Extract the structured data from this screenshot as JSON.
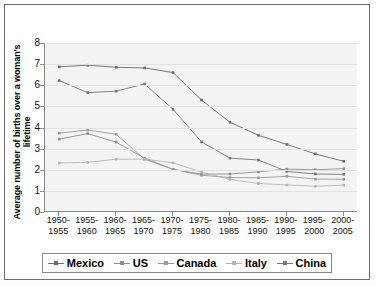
{
  "chart_data": {
    "type": "line",
    "title": "",
    "xlabel": "",
    "ylabel": "Average number of births over a woman's lifetime",
    "ylim": [
      0,
      8
    ],
    "yticks": [
      0,
      1,
      2,
      3,
      4,
      5,
      6,
      7,
      8
    ],
    "grid": true,
    "legend_position": "bottom",
    "categories": [
      "1950-1955",
      "1955-1960",
      "1960-1965",
      "1965-1970",
      "1970-1975",
      "1975-1980",
      "1980-1985",
      "1985-1990",
      "1990-1995",
      "1995-2000",
      "2000-2005"
    ],
    "categories_lines": [
      [
        "1950-",
        "1955"
      ],
      [
        "1955-",
        "1960"
      ],
      [
        "1960-",
        "1965"
      ],
      [
        "1965-",
        "1970"
      ],
      [
        "1970-",
        "1975"
      ],
      [
        "1975-",
        "1980"
      ],
      [
        "1980-",
        "1985"
      ],
      [
        "1985-",
        "1990"
      ],
      [
        "1990-",
        "1995"
      ],
      [
        "1995-",
        "2000"
      ],
      [
        "2000-",
        "2005"
      ]
    ],
    "series": [
      {
        "name": "Mexico",
        "color": "#6b6b6b",
        "values": [
          6.87,
          6.95,
          6.85,
          6.82,
          6.6,
          5.3,
          4.25,
          3.63,
          3.2,
          2.75,
          2.4
        ]
      },
      {
        "name": "US",
        "color": "#8f8f8f",
        "values": [
          3.45,
          3.71,
          3.31,
          2.55,
          2.02,
          1.79,
          1.8,
          1.9,
          2.03,
          2.0,
          2.05
        ]
      },
      {
        "name": "Canada",
        "color": "#9a9a9a",
        "values": [
          3.73,
          3.88,
          3.68,
          2.5,
          2.02,
          1.74,
          1.63,
          1.62,
          1.69,
          1.56,
          1.55
        ]
      },
      {
        "name": "Italy",
        "color": "#b5b5b5",
        "values": [
          2.32,
          2.35,
          2.5,
          2.5,
          2.33,
          1.89,
          1.54,
          1.35,
          1.28,
          1.22,
          1.27
        ]
      },
      {
        "name": "China",
        "color": "#777777",
        "values": [
          6.22,
          5.65,
          5.72,
          6.06,
          4.86,
          3.32,
          2.55,
          2.46,
          1.92,
          1.8,
          1.78
        ]
      }
    ]
  },
  "legend": {
    "items": [
      {
        "label": "Mexico"
      },
      {
        "label": "US"
      },
      {
        "label": "Canada"
      },
      {
        "label": "Italy"
      },
      {
        "label": "China"
      }
    ]
  }
}
